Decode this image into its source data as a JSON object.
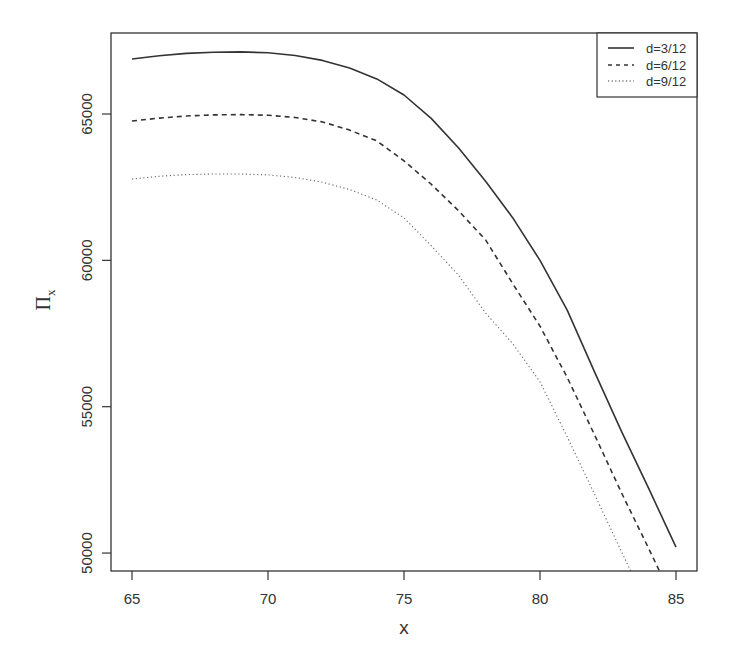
{
  "chart_data": {
    "type": "line",
    "title": "",
    "xlabel": "x",
    "ylabel": "Π_x",
    "ylabel_main": "Π",
    "ylabel_sub": "x",
    "xlim": [
      64.3,
      86.1
    ],
    "ylim": [
      49400,
      67700
    ],
    "grid": false,
    "legend_position": "top-right",
    "x_ticks": [
      65,
      70,
      75,
      80,
      85
    ],
    "y_ticks": [
      50000,
      55000,
      60000,
      65000
    ],
    "x": [
      65,
      66,
      67,
      68,
      69,
      70,
      71,
      72,
      73,
      74,
      75,
      76,
      77,
      78,
      79,
      80,
      81,
      82,
      83,
      84,
      85
    ],
    "series": [
      {
        "name": "d=3/12",
        "style": "solid",
        "values": [
          66880,
          66990,
          67070,
          67110,
          67120,
          67090,
          67000,
          66830,
          66570,
          66200,
          65650,
          64850,
          63850,
          62700,
          61450,
          60000,
          58300,
          56200,
          54150,
          52200,
          50200
        ]
      },
      {
        "name": "d=6/12",
        "style": "dashed",
        "values": [
          64760,
          64860,
          64930,
          64970,
          64980,
          64960,
          64880,
          64730,
          64450,
          64080,
          63400,
          62600,
          61700,
          60700,
          59200,
          57750,
          56000,
          54050,
          52050,
          50150,
          48200
        ]
      },
      {
        "name": "d=9/12",
        "style": "dotted",
        "values": [
          62780,
          62870,
          62930,
          62950,
          62950,
          62920,
          62830,
          62670,
          62420,
          62060,
          61450,
          60500,
          59500,
          58200,
          57150,
          55850,
          53970,
          52020,
          50040,
          48100,
          46200
        ]
      }
    ]
  },
  "legend": {
    "items": [
      {
        "label": "d=3/12",
        "style": "solid"
      },
      {
        "label": "d=6/12",
        "style": "dashed"
      },
      {
        "label": "d=9/12",
        "style": "dotted"
      }
    ]
  },
  "colors": {
    "line": "#333333",
    "axis": "#333333",
    "background": "#ffffff"
  }
}
